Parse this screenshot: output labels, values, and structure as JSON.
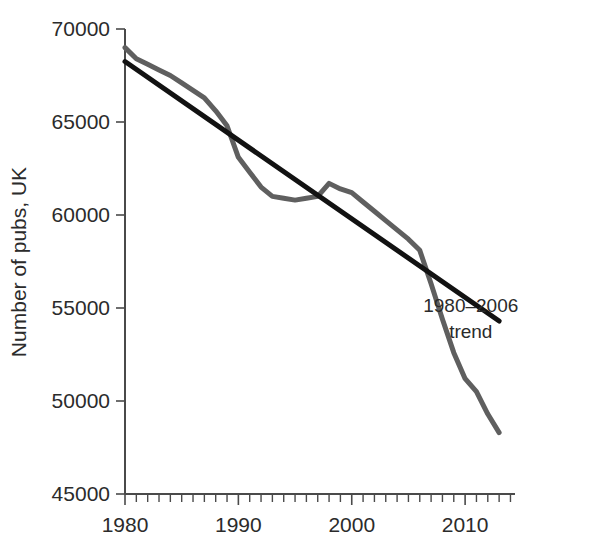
{
  "chart_data": {
    "type": "line",
    "title": "",
    "subtitle": "",
    "xlabel": "",
    "ylabel": "Number of pubs, UK",
    "xlim": [
      1980,
      2013
    ],
    "ylim": [
      45000,
      70000
    ],
    "grid": false,
    "legend_position": "inline-annotation",
    "x_ticks_major": [
      "1980",
      "1990",
      "2000",
      "2010"
    ],
    "x_ticks_major_values": [
      1980,
      1990,
      2000,
      2010
    ],
    "x_tick_minor_step": 1,
    "y_ticks": [
      "45000",
      "50000",
      "55000",
      "60000",
      "65000",
      "70000"
    ],
    "y_tick_values": [
      45000,
      50000,
      55000,
      60000,
      65000,
      70000
    ],
    "annotations": [
      {
        "name": "trend-label",
        "line1": "1980–2006",
        "line2": "trend",
        "x": 2010.5,
        "y": 54800
      }
    ],
    "series": [
      {
        "name": "Number of pubs, UK",
        "color": "#5f5f5f",
        "width": 5,
        "x": [
          1980,
          1981,
          1982,
          1983,
          1984,
          1985,
          1986,
          1987,
          1988,
          1989,
          1990,
          1991,
          1992,
          1993,
          1994,
          1995,
          1996,
          1997,
          1998,
          1999,
          2000,
          2001,
          2002,
          2003,
          2004,
          2005,
          2006,
          2007,
          2008,
          2009,
          2010,
          2011,
          2012,
          2013
        ],
        "values": [
          69000,
          68400,
          68100,
          67800,
          67500,
          67100,
          66700,
          66300,
          65600,
          64800,
          63100,
          62300,
          61500,
          61000,
          60900,
          60800,
          60900,
          61000,
          61700,
          61400,
          61200,
          60700,
          60200,
          59700,
          59200,
          58700,
          58100,
          56300,
          54400,
          52600,
          51200,
          50500,
          49300,
          48300
        ]
      },
      {
        "name": "1980–2006 trend",
        "color": "#121212",
        "width": 5,
        "x": [
          1980,
          2013
        ],
        "values": [
          68250,
          54300
        ]
      }
    ]
  }
}
